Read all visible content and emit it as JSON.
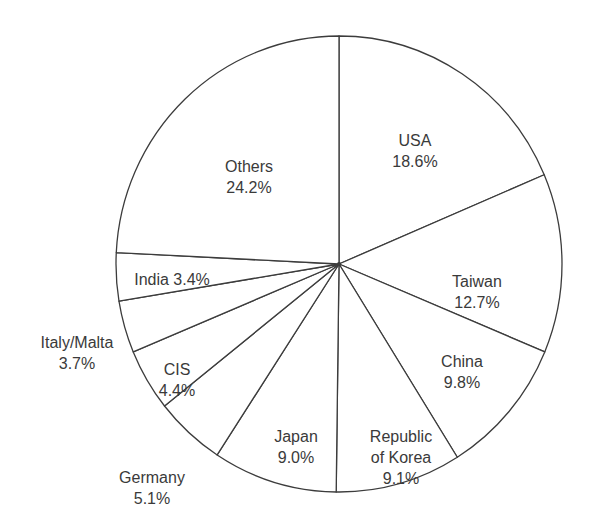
{
  "chart_data": {
    "type": "pie",
    "title": "",
    "start_angle_deg": 0,
    "direction": "clockwise",
    "center": [
      339,
      264
    ],
    "radius": [
      223,
      228
    ],
    "stroke_color": "#3c3c3c",
    "fill_color": "#ffffff",
    "slices": [
      {
        "label": "USA",
        "value": 18.6,
        "text": [
          "USA",
          "18.6%"
        ],
        "label_pos": [
          415,
          151
        ]
      },
      {
        "label": "Taiwan",
        "value": 12.7,
        "text": [
          "Taiwan",
          "12.7%"
        ],
        "label_pos": [
          477,
          292
        ]
      },
      {
        "label": "China",
        "value": 9.8,
        "text": [
          "China",
          "9.8%"
        ],
        "label_pos": [
          462,
          372
        ]
      },
      {
        "label": "Republic of Korea",
        "value": 9.1,
        "text": [
          "Republic",
          "of Korea",
          "9.1%"
        ],
        "label_pos": [
          401,
          457
        ]
      },
      {
        "label": "Japan",
        "value": 9.0,
        "text": [
          "Japan",
          "9.0%"
        ],
        "label_pos": [
          296,
          447
        ]
      },
      {
        "label": "Germany",
        "value": 5.1,
        "text": [
          "Germany",
          "5.1%"
        ],
        "label_pos": [
          152,
          488
        ]
      },
      {
        "label": "CIS",
        "value": 4.4,
        "text": [
          "CIS",
          "4.4%"
        ],
        "label_pos": [
          177,
          380
        ]
      },
      {
        "label": "Italy/Malta",
        "value": 3.7,
        "text": [
          "Italy/Malta",
          "3.7%"
        ],
        "label_pos": [
          77,
          353
        ]
      },
      {
        "label": "India",
        "value": 3.4,
        "text": [
          "India 3.4%"
        ],
        "label_pos": [
          172,
          279
        ]
      },
      {
        "label": "Others",
        "value": 24.2,
        "text": [
          "Others",
          "24.2%"
        ],
        "label_pos": [
          249,
          177
        ]
      }
    ]
  }
}
